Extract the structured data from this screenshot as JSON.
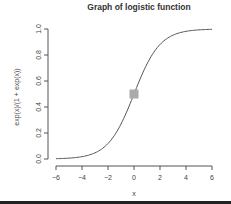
{
  "chart_data": {
    "type": "line",
    "title": "Graph of logistic function",
    "xlabel": "x",
    "ylabel": "exp(x)/(1 + exp(x))",
    "xlim": [
      -6,
      6
    ],
    "ylim": [
      0,
      1
    ],
    "x_ticks": [
      "-6",
      "-4",
      "-2",
      "0",
      "2",
      "4",
      "6"
    ],
    "y_ticks": [
      "0.0",
      "0.2",
      "0.4",
      "0.6",
      "0.8",
      "1.0"
    ],
    "grid": false,
    "series": [
      {
        "name": "logistic",
        "function": "exp(x)/(1+exp(x))",
        "x": [
          -6,
          -5,
          -4,
          -3,
          -2,
          -1,
          0,
          1,
          2,
          3,
          4,
          5,
          6
        ],
        "y": [
          0.0025,
          0.0067,
          0.018,
          0.047,
          0.119,
          0.269,
          0.5,
          0.731,
          0.881,
          0.953,
          0.982,
          0.9933,
          0.9975
        ],
        "color": "#555555"
      }
    ],
    "annotations": [
      {
        "type": "marker",
        "shape": "square",
        "x": 0,
        "y": 0.5,
        "color": "#aaaaaa"
      }
    ]
  }
}
